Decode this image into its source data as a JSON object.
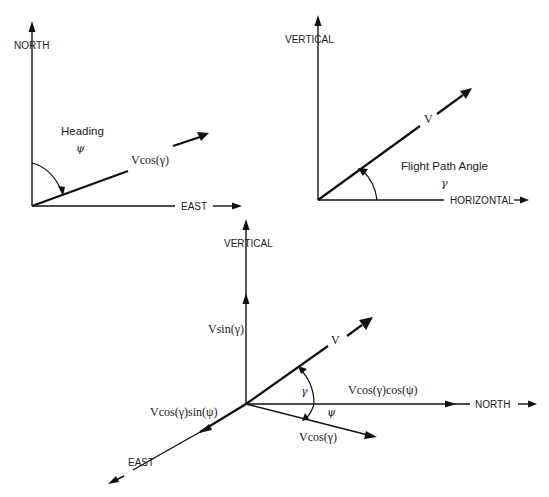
{
  "diagrams": {
    "heading": {
      "axis_north": "NORTH",
      "axis_east": "EAST",
      "angle_title": "Heading",
      "angle_symbol": "ψ",
      "vector_label": "Vcos(γ)"
    },
    "flight_path": {
      "axis_vertical": "VERTICAL",
      "axis_horizontal": "HORIZONTAL",
      "vector_label": "V",
      "angle_title": "Flight Path Angle",
      "angle_symbol": "γ"
    },
    "three_d": {
      "axis_vertical": "VERTICAL",
      "axis_north": "NORTH",
      "axis_east": "EAST",
      "vector_label": "V",
      "vertical_component": "Vsin(γ)",
      "north_component": "Vcos(γ)cos(ψ)",
      "east_component": "Vcos(γ)sin(ψ)",
      "horizontal_projection": "Vcos(γ)",
      "gamma_symbol": "γ",
      "psi_symbol": "ψ"
    }
  }
}
